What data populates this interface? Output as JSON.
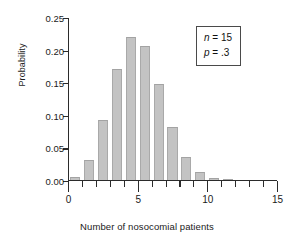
{
  "chart_data": {
    "type": "bar",
    "title": "",
    "subtitle": "",
    "xlabel": "Number of nosocomial patients",
    "ylabel": "Probability",
    "categories": [
      0,
      1,
      2,
      3,
      4,
      5,
      6,
      7,
      8,
      9,
      10,
      11,
      12,
      13,
      14,
      15
    ],
    "values": [
      0.0047,
      0.0305,
      0.0916,
      0.17,
      0.2186,
      0.2061,
      0.1472,
      0.0811,
      0.0348,
      0.0116,
      0.003,
      0.0006,
      0.0001,
      0.0,
      0.0,
      0.0
    ],
    "series": [
      {
        "name": "Binomial probability",
        "values": [
          0.0047,
          0.0305,
          0.0916,
          0.17,
          0.2186,
          0.2061,
          0.1472,
          0.0811,
          0.0348,
          0.0116,
          0.003,
          0.0006,
          0.0001,
          0.0,
          0.0,
          0.0
        ]
      }
    ],
    "xlim": [
      0,
      15
    ],
    "ylim": [
      0.0,
      0.25
    ],
    "x_tick_labels": [
      "0",
      "5",
      "10",
      "15"
    ],
    "x_tick_values": [
      0,
      5,
      10,
      15
    ],
    "x_minor_ticks": [
      1,
      2,
      3,
      4,
      6,
      7,
      8,
      9,
      11,
      12,
      13,
      14
    ],
    "y_tick_labels": [
      "0.00",
      "0.05",
      "0.10",
      "0.15",
      "0.20",
      "0.25"
    ],
    "y_tick_values": [
      0.0,
      0.05,
      0.1,
      0.15,
      0.2,
      0.25
    ],
    "grid": false,
    "legend_position": "upper-right",
    "bar_color": "#c3c3c3",
    "axis_color": "#2b2b2b",
    "text_color": "#1a1a1a",
    "annotations": [
      {
        "symbol": "n",
        "operator": "=",
        "value": "15"
      },
      {
        "symbol": "p",
        "operator": "=",
        ".value": "",
        "value": ".3"
      }
    ]
  },
  "annotation_box": {
    "line1_symbol": "n",
    "line1_text": " = 15",
    "line2_symbol": "p",
    "line2_text": " = .3"
  }
}
